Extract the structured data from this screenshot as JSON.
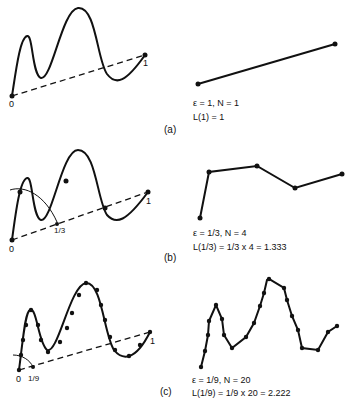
{
  "panels": [
    {
      "id": "a",
      "caption": "(a)",
      "epsilon_line": "ε = 1,  N = 1",
      "length_line": "L(1) = 1",
      "ticks": [
        "0",
        "1"
      ]
    },
    {
      "id": "b",
      "caption": "(b)",
      "epsilon_line": "ε = 1/3,  N = 4",
      "length_line": "L(1/3) = 1/3 x 4 = 1.333",
      "ticks": [
        "0",
        "1/3",
        "1"
      ]
    },
    {
      "id": "c",
      "caption": "(c)",
      "epsilon_line": "ε = 1/9,  N = 20",
      "length_line": "L(1/9) = 1/9 x 20 = 2.222",
      "ticks": [
        "0",
        "1/9",
        "1"
      ]
    }
  ]
}
